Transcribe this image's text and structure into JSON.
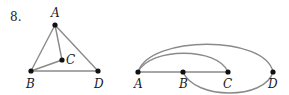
{
  "problem_number": "8.",
  "graphs": [
    {
      "id": "graph-left",
      "vertices": [
        {
          "label": "A",
          "x": 55,
          "y": 25
        },
        {
          "label": "B",
          "x": 31,
          "y": 71
        },
        {
          "label": "C",
          "x": 62,
          "y": 60
        },
        {
          "label": "D",
          "x": 98,
          "y": 71
        }
      ],
      "edges": [
        [
          "A",
          "B"
        ],
        [
          "A",
          "C"
        ],
        [
          "A",
          "D"
        ],
        [
          "B",
          "C"
        ],
        [
          "B",
          "D"
        ]
      ]
    },
    {
      "id": "graph-right",
      "vertices": [
        {
          "label": "A",
          "x": 138,
          "y": 72
        },
        {
          "label": "B",
          "x": 183,
          "y": 72
        },
        {
          "label": "C",
          "x": 228,
          "y": 72
        },
        {
          "label": "D",
          "x": 273,
          "y": 72
        }
      ],
      "edges": [
        [
          "A",
          "B"
        ],
        [
          "B",
          "C"
        ],
        [
          "A",
          "C",
          "arc-above"
        ],
        [
          "A",
          "D",
          "arc-above"
        ],
        [
          "B",
          "D",
          "arc-below"
        ]
      ]
    }
  ],
  "labels": {
    "left": {
      "A": "A",
      "B": "B",
      "C": "C",
      "D": "D"
    },
    "right": {
      "A": "A",
      "B": "B",
      "C": "C",
      "D": "D"
    }
  },
  "colors": {
    "edge": "#8a8a8a",
    "node": "#111111"
  }
}
